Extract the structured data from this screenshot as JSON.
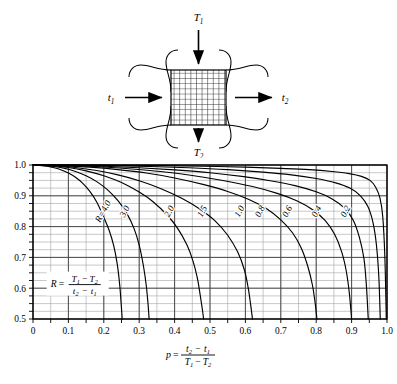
{
  "figure": {
    "diagram": {
      "name": "cross-flow-heat-exchanger",
      "top_label": "T1",
      "top_label_base": "T",
      "top_label_sub": "1",
      "bottom_label_base": "T",
      "bottom_label_sub": "2",
      "left_label_base": "t",
      "left_label_sub": "1",
      "right_label_base": "t",
      "right_label_sub": "2",
      "core_rows": 10,
      "core_cols": 10
    }
  },
  "chart_data": {
    "type": "line",
    "title": "",
    "xlabel": "p = (t2 - t1) / (T1 - T2)",
    "ylabel": "",
    "xlim": [
      0,
      1.0
    ],
    "ylim": [
      0.5,
      1.0
    ],
    "grid": true,
    "grid_minor_x": 0.05,
    "grid_minor_y": 0.025,
    "legend": "inline curve labels",
    "xticks": [
      "0",
      "0.1",
      "0.2",
      "0.3",
      "0.4",
      "0.5",
      "0.6",
      "0.7",
      "0.8",
      "0.9",
      "1.0"
    ],
    "xtick_values": [
      0,
      0.1,
      0.2,
      0.3,
      0.4,
      0.5,
      0.6,
      0.7,
      0.8,
      0.9,
      1.0
    ],
    "yticks": [
      "0.5",
      "0.6",
      "0.7",
      "0.8",
      "0.9",
      "1.0"
    ],
    "ytick_values": [
      0.5,
      0.6,
      0.7,
      0.8,
      0.9,
      1.0
    ],
    "annotation": {
      "text": "R = (T1 - T2) / (t2 - t1)",
      "symbol": "R",
      "num_a": "T",
      "num_a_sub": "1",
      "num_b": "T",
      "num_b_sub": "2",
      "den_a": "t",
      "den_a_sub": "2",
      "den_b": "t",
      "den_b_sub": "1",
      "x": 0.05,
      "y": 0.615
    },
    "axis_formula": {
      "symbol": "p",
      "num_a": "t",
      "num_a_sub": "2",
      "num_b": "t",
      "num_b_sub": "1",
      "den_a": "T",
      "den_a_sub": "1",
      "den_b": "T",
      "den_b_sub": "2"
    },
    "series": [
      {
        "name": "R=4.0",
        "label": "R=4.0",
        "label_x": 0.205,
        "label_y": 0.845,
        "x": [
          0.0,
          0.02,
          0.04,
          0.06,
          0.08,
          0.1,
          0.12,
          0.14,
          0.16,
          0.18,
          0.2,
          0.215,
          0.228,
          0.238,
          0.245,
          0.249,
          0.252
        ],
        "y": [
          1.0,
          0.999,
          0.996,
          0.991,
          0.984,
          0.974,
          0.96,
          0.941,
          0.915,
          0.88,
          0.83,
          0.788,
          0.738,
          0.678,
          0.61,
          0.55,
          0.5
        ]
      },
      {
        "name": "3.0",
        "label": "3.0",
        "label_x": 0.266,
        "label_y": 0.845,
        "x": [
          0.0,
          0.03,
          0.06,
          0.09,
          0.12,
          0.15,
          0.18,
          0.21,
          0.24,
          0.265,
          0.285,
          0.3,
          0.312,
          0.32,
          0.325,
          0.328
        ],
        "y": [
          1.0,
          0.999,
          0.995,
          0.989,
          0.979,
          0.965,
          0.946,
          0.92,
          0.884,
          0.843,
          0.795,
          0.74,
          0.672,
          0.608,
          0.548,
          0.5
        ]
      },
      {
        "name": "2.0",
        "label": "2.0",
        "label_x": 0.392,
        "label_y": 0.845,
        "x": [
          0.0,
          0.05,
          0.1,
          0.15,
          0.2,
          0.25,
          0.3,
          0.34,
          0.38,
          0.41,
          0.435,
          0.452,
          0.464,
          0.472,
          0.478,
          0.482
        ],
        "y": [
          1.0,
          0.998,
          0.992,
          0.981,
          0.965,
          0.943,
          0.912,
          0.88,
          0.836,
          0.792,
          0.74,
          0.688,
          0.634,
          0.58,
          0.535,
          0.5
        ]
      },
      {
        "name": "1.5",
        "label": "1.5",
        "label_x": 0.485,
        "label_y": 0.845,
        "x": [
          0.0,
          0.06,
          0.12,
          0.18,
          0.24,
          0.3,
          0.36,
          0.42,
          0.47,
          0.515,
          0.55,
          0.578,
          0.597,
          0.608,
          0.615,
          0.62
        ],
        "y": [
          1.0,
          0.998,
          0.992,
          0.982,
          0.968,
          0.949,
          0.924,
          0.892,
          0.858,
          0.818,
          0.772,
          0.718,
          0.66,
          0.6,
          0.545,
          0.5
        ]
      },
      {
        "name": "1.0",
        "label": "1.0",
        "label_x": 0.59,
        "label_y": 0.845,
        "x": [
          0.0,
          0.08,
          0.16,
          0.24,
          0.32,
          0.4,
          0.48,
          0.55,
          0.61,
          0.66,
          0.7,
          0.733,
          0.758,
          0.776,
          0.789,
          0.797,
          0.802
        ],
        "y": [
          1.0,
          0.998,
          0.993,
          0.985,
          0.974,
          0.958,
          0.937,
          0.914,
          0.888,
          0.858,
          0.822,
          0.78,
          0.73,
          0.672,
          0.612,
          0.552,
          0.5
        ]
      },
      {
        "name": "0.8",
        "label": "0.8",
        "label_x": 0.648,
        "label_y": 0.845,
        "x": [
          0.0,
          0.09,
          0.18,
          0.27,
          0.36,
          0.45,
          0.54,
          0.62,
          0.69,
          0.745,
          0.79,
          0.825,
          0.852,
          0.872,
          0.885,
          0.894,
          0.9
        ],
        "y": [
          1.0,
          0.999,
          0.995,
          0.988,
          0.979,
          0.966,
          0.949,
          0.93,
          0.908,
          0.884,
          0.855,
          0.82,
          0.775,
          0.718,
          0.655,
          0.58,
          0.5
        ]
      },
      {
        "name": "0.6",
        "label": "0.6",
        "label_x": 0.725,
        "label_y": 0.845,
        "x": [
          0.0,
          0.1,
          0.2,
          0.3,
          0.4,
          0.5,
          0.59,
          0.67,
          0.74,
          0.8,
          0.845,
          0.88,
          0.905,
          0.922,
          0.935,
          0.942,
          0.947
        ],
        "y": [
          1.0,
          0.999,
          0.996,
          0.991,
          0.984,
          0.975,
          0.963,
          0.949,
          0.933,
          0.913,
          0.89,
          0.86,
          0.82,
          0.765,
          0.695,
          0.605,
          0.5
        ]
      },
      {
        "name": "0.4",
        "label": "0.4",
        "label_x": 0.808,
        "label_y": 0.845,
        "x": [
          0.0,
          0.11,
          0.22,
          0.33,
          0.44,
          0.55,
          0.65,
          0.73,
          0.8,
          0.855,
          0.895,
          0.925,
          0.946,
          0.96,
          0.97,
          0.977,
          0.981
        ],
        "y": [
          1.0,
          1.0,
          0.998,
          0.995,
          0.991,
          0.985,
          0.977,
          0.968,
          0.956,
          0.942,
          0.925,
          0.9,
          0.865,
          0.815,
          0.742,
          0.635,
          0.5
        ]
      },
      {
        "name": "0.2",
        "label": "0.2",
        "label_x": 0.89,
        "label_y": 0.845,
        "x": [
          0.0,
          0.12,
          0.24,
          0.36,
          0.48,
          0.6,
          0.7,
          0.78,
          0.845,
          0.893,
          0.928,
          0.952,
          0.968,
          0.98,
          0.988,
          0.994,
          0.998
        ],
        "y": [
          1.0,
          1.0,
          0.999,
          0.998,
          0.996,
          0.993,
          0.989,
          0.985,
          0.979,
          0.972,
          0.963,
          0.95,
          0.928,
          0.893,
          0.832,
          0.7,
          0.5
        ]
      }
    ]
  }
}
